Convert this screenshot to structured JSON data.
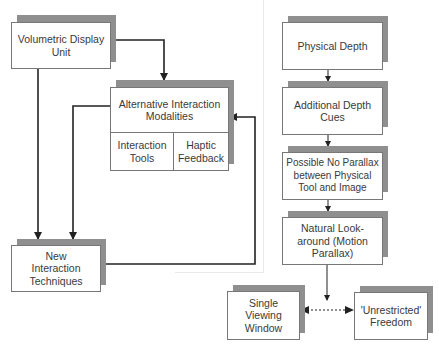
{
  "diagram": {
    "left_panel": {
      "volumetric_display": {
        "label": "Volumetric Display Unit"
      },
      "alternative_modalities": {
        "label": "Alternative Interaction Modalities",
        "sub_items": [
          "Interaction Tools",
          "Haptic Feedback"
        ]
      },
      "new_techniques": {
        "label": "New Interaction Techniques"
      }
    },
    "right_panel": {
      "steps": [
        {
          "label": "Physical Depth"
        },
        {
          "label": "Additional Depth Cues"
        },
        {
          "label": "Possible No Parallax between Physical Tool and Image"
        },
        {
          "label": "Natural Look-around (Motion Parallax)"
        }
      ],
      "outcomes": [
        {
          "label": "Single Viewing Window"
        },
        {
          "label": "'Unrestricted' Freedom"
        }
      ]
    },
    "edges": [
      {
        "from": "Volumetric Display Unit",
        "to": "Alternative Interaction Modalities",
        "style": "solid"
      },
      {
        "from": "Volumetric Display Unit",
        "to": "New Interaction Techniques",
        "style": "solid"
      },
      {
        "from": "Alternative Interaction Modalities",
        "to": "New Interaction Techniques",
        "style": "solid"
      },
      {
        "from": "New Interaction Techniques",
        "to": "Alternative Interaction Modalities",
        "style": "solid"
      },
      {
        "from": "Physical Depth",
        "to": "Additional Depth Cues",
        "style": "solid"
      },
      {
        "from": "Additional Depth Cues",
        "to": "Possible No Parallax between Physical Tool and Image",
        "style": "solid"
      },
      {
        "from": "Possible No Parallax between Physical Tool and Image",
        "to": "Natural Look-around (Motion Parallax)",
        "style": "solid"
      },
      {
        "from": "Natural Look-around (Motion Parallax)",
        "to": "Single Viewing Window / 'Unrestricted' Freedom",
        "style": "solid"
      },
      {
        "from": "Single Viewing Window",
        "to": "'Unrestricted' Freedom",
        "style": "dotted-bidirectional"
      }
    ],
    "colors": {
      "shadow": "#8f8f8f",
      "border": "#777777",
      "line": "#222222",
      "divider": "#e8e8e8"
    }
  }
}
